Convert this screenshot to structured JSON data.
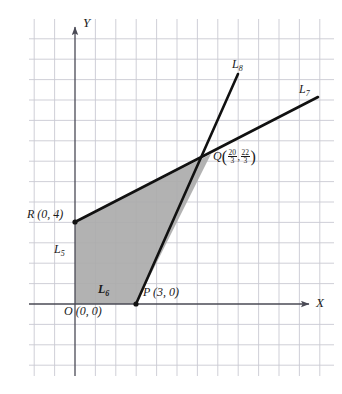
{
  "figure": {
    "kind": "cartesian-plane-diagram",
    "background_color": "#ffffff",
    "grid_color": "#c9c9d2",
    "axis_color": "#4a4a55",
    "line_color": "#111111",
    "shade_color": "#ababab",
    "grid_spacing_px": 20.4,
    "origin_px": {
      "x": 75,
      "y": 304
    },
    "grid_extent_px": {
      "left": 29,
      "right": 334,
      "top": 19,
      "bottom": 376
    }
  },
  "axes": {
    "x_label": "X",
    "y_label": "Y",
    "x_axis_px": {
      "x1": 29,
      "x2": 313,
      "y": 304
    },
    "y_axis_px": {
      "y1": 23,
      "y2": 376,
      "x": 75
    }
  },
  "points": [
    {
      "name": "O",
      "label": "O (0, 0)",
      "symbol": "O",
      "coords_text": "(0, 0)",
      "x": 0,
      "y": 0,
      "px": {
        "x": 75,
        "y": 304
      },
      "label_px": {
        "x": 72,
        "y": 306
      }
    },
    {
      "name": "R",
      "label": "R (0, 4)",
      "symbol": "R",
      "coords_text": "(0, 4)",
      "x": 0,
      "y": 4,
      "px": {
        "x": 75,
        "y": 222
      },
      "label_px": {
        "x": 29,
        "y": 214
      }
    },
    {
      "name": "P",
      "label": "P (3, 0)",
      "symbol": "P",
      "coords_text": "(3, 0)",
      "x": 3,
      "y": 0,
      "px": {
        "x": 136,
        "y": 304
      },
      "label_px": {
        "x": 143,
        "y": 289
      }
    },
    {
      "name": "Q",
      "symbol": "Q",
      "x_num": "20",
      "x_den": "3",
      "y_num": "22",
      "y_den": "3",
      "x": 6.6667,
      "y": 7.3333,
      "px": {
        "x": 211,
        "y": 154
      },
      "label_px": {
        "x": 214,
        "y": 149
      }
    }
  ],
  "lines": [
    {
      "id": "L5",
      "base": "L",
      "sub": "5",
      "role": "y-axis segment boundary",
      "label_px": {
        "x": 55,
        "y": 249
      }
    },
    {
      "id": "L6",
      "base": "L",
      "sub": "6",
      "role": "x-axis segment boundary",
      "label_px": {
        "x": 99,
        "y": 288
      }
    },
    {
      "id": "L7",
      "base": "L",
      "sub": "7",
      "role": "line through R(0,4) and Q",
      "from_px": {
        "x": 75,
        "y": 222
      },
      "to_px": {
        "x": 318,
        "y": 97
      },
      "label_px": {
        "x": 299,
        "y": 88
      }
    },
    {
      "id": "L8",
      "base": "L",
      "sub": "8",
      "role": "line through P(3,0) and Q",
      "from_px": {
        "x": 136,
        "y": 304
      },
      "to_px": {
        "x": 238,
        "y": 74
      },
      "label_px": {
        "x": 233,
        "y": 63
      }
    }
  ],
  "shaded_region": {
    "description": "feasible region bounded by O, P, Q, R",
    "vertices_px": [
      {
        "x": 75,
        "y": 304
      },
      {
        "x": 136,
        "y": 304
      },
      {
        "x": 211,
        "y": 154
      },
      {
        "x": 75,
        "y": 222
      }
    ]
  }
}
